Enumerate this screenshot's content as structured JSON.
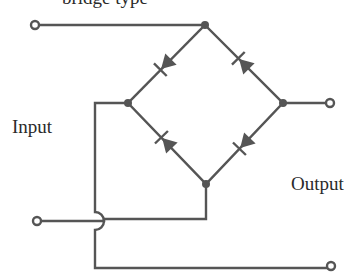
{
  "diagram": {
    "type": "full-wave bridge rectifier",
    "caption_fragment": "bridge type",
    "labels": {
      "input": "Input",
      "output": "Output"
    },
    "colors": {
      "wire": "#555555",
      "text": "#2a2a2a",
      "background": "#ffffff"
    },
    "nodes": {
      "top": [
        205,
        25
      ],
      "left": [
        128,
        103
      ],
      "right": [
        283,
        103
      ],
      "bottom": [
        206,
        184
      ]
    },
    "terminals": [
      {
        "name": "input-terminal-top",
        "pos": [
          35,
          25
        ]
      },
      {
        "name": "input-terminal-bottom",
        "pos": [
          37,
          221
        ]
      },
      {
        "name": "output-terminal-top",
        "pos": [
          330,
          103
        ]
      },
      {
        "name": "output-terminal-bottom",
        "pos": [
          331,
          266
        ]
      }
    ],
    "diodes": [
      {
        "name": "diode-top-left",
        "anode": "top",
        "cathode": "left"
      },
      {
        "name": "diode-top-right",
        "anode": "right",
        "cathode": "top"
      },
      {
        "name": "diode-bottom-left",
        "anode": "bottom",
        "cathode": "left"
      },
      {
        "name": "diode-bottom-right",
        "anode": "right",
        "cathode": "bottom"
      }
    ]
  }
}
